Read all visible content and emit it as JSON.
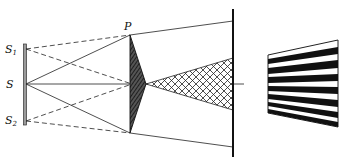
{
  "diagram": {
    "labels": {
      "source_1": "S",
      "source_1_sub": "1",
      "source": "S",
      "source_2": "S",
      "source_2_sub": "2",
      "prism": "P"
    },
    "colors": {
      "line": "#222222",
      "background": "#ffffff",
      "fringe_dark": "#111111",
      "slit": "#9a9a9a"
    },
    "fringe_bands": 7
  }
}
